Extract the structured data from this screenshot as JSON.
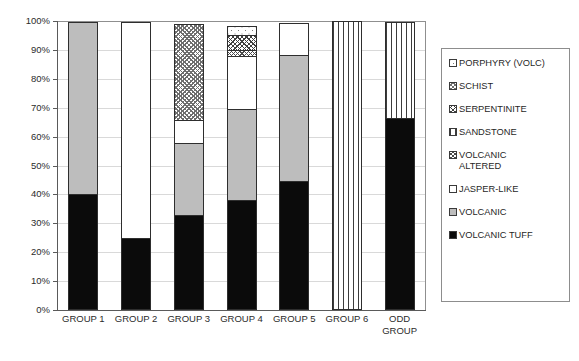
{
  "chart_data": {
    "type": "bar",
    "subtype": "stacked-percentage",
    "title": "",
    "xlabel": "",
    "ylabel": "",
    "ylim": [
      0,
      100
    ],
    "ytick_labels": [
      "0%",
      "10%",
      "20%",
      "30%",
      "40%",
      "50%",
      "60%",
      "70%",
      "80%",
      "90%",
      "100%"
    ],
    "ytick_values": [
      0,
      10,
      20,
      30,
      40,
      50,
      60,
      70,
      80,
      90,
      100
    ],
    "grid": true,
    "legend_position": "right",
    "categories": [
      "GROUP 1",
      "GROUP 2",
      "GROUP 3",
      "GROUP 4",
      "GROUP 5",
      "GROUP 6",
      "ODD GROUP"
    ],
    "series": [
      {
        "name": "VOLCANIC TUFF",
        "pattern": "solid-black",
        "values": [
          40.0,
          25.0,
          33.0,
          38.0,
          44.5,
          0.0,
          66.5
        ]
      },
      {
        "name": "VOLCANIC",
        "pattern": "solid-gray",
        "values": [
          60.0,
          0.0,
          25.0,
          32.0,
          44.0,
          0.0,
          0.0
        ]
      },
      {
        "name": "JASPER-LIKE",
        "pattern": "fine-dots",
        "values": [
          0.0,
          75.0,
          8.5,
          18.5,
          11.5,
          0.0,
          0.0
        ]
      },
      {
        "name": "VOLCANIC ALTERED",
        "pattern": "cross-diagonal",
        "values": [
          0.0,
          0.0,
          0.0,
          2.5,
          0.0,
          0.0,
          0.0
        ]
      },
      {
        "name": "SANDSTONE",
        "pattern": "vertical-lines",
        "values": [
          0.0,
          0.0,
          0.0,
          0.0,
          0.0,
          100.0,
          33.5
        ]
      },
      {
        "name": "SERPENTINITE",
        "pattern": "dense-crosshatch",
        "values": [
          0.0,
          0.0,
          0.0,
          5.5,
          0.0,
          0.0,
          0.0
        ]
      },
      {
        "name": "SCHIST",
        "pattern": "diagonal-hatch",
        "values": [
          0.0,
          0.0,
          33.5,
          0.0,
          0.0,
          0.0,
          0.0
        ]
      },
      {
        "name": "PORPHYRY (VOLC)",
        "pattern": "sparse-dots",
        "values": [
          0.0,
          0.0,
          0.0,
          3.5,
          0.0,
          0.0,
          0.0
        ]
      }
    ]
  },
  "legend": {
    "items": [
      {
        "label": "PORPHYRY (VOLC)"
      },
      {
        "label": "SCHIST"
      },
      {
        "label": "SERPENTINITE"
      },
      {
        "label": "SANDSTONE"
      },
      {
        "label": "VOLCANIC\nALTERED"
      },
      {
        "label": "JASPER-LIKE"
      },
      {
        "label": "VOLCANIC"
      },
      {
        "label": "VOLCANIC TUFF"
      }
    ]
  },
  "axis": {
    "y_ticks": [
      "100%",
      "90%",
      "80%",
      "70%",
      "60%",
      "50%",
      "40%",
      "30%",
      "20%",
      "10%",
      "0%"
    ],
    "x_labels": [
      "GROUP 1",
      "GROUP 2",
      "GROUP 3",
      "GROUP 4",
      "GROUP 5",
      "GROUP 6",
      "ODD\nGROUP"
    ]
  },
  "colors": {
    "tuff": "#0b0b0b",
    "volcanic": "#bdbdbd",
    "grid": "#d9d9d9",
    "axis": "#5a5a5a",
    "text": "#2b2b2b",
    "legend_border": "#8d8d8d"
  }
}
